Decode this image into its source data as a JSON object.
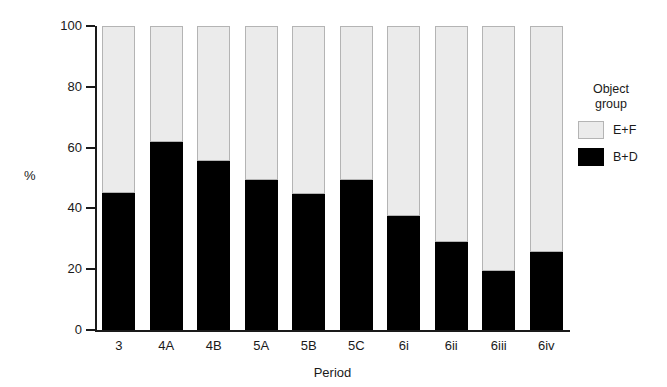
{
  "chart_data": {
    "type": "bar",
    "subtype": "stacked-percentage",
    "title": "",
    "xlabel": "Period",
    "ylabel": "%",
    "ylim": [
      0,
      100
    ],
    "yticks": [
      0,
      20,
      40,
      60,
      80,
      100
    ],
    "grid": false,
    "categories": [
      "3",
      "4A",
      "4B",
      "5A",
      "5B",
      "5C",
      "6i",
      "6ii",
      "6iii",
      "6iv"
    ],
    "series": [
      {
        "name": "B+D",
        "color": "#000000",
        "values": [
          45,
          61.8,
          55.6,
          49.3,
          44.7,
          49.3,
          37.5,
          28.8,
          19.4,
          25.7
        ]
      },
      {
        "name": "E+F",
        "color": "#ebebeb",
        "values": [
          55,
          38.2,
          44.4,
          50.7,
          55.3,
          50.7,
          62.5,
          71.2,
          80.6,
          74.3
        ]
      }
    ],
    "legend": {
      "title_line1": "Object",
      "title_line2": "group",
      "position": "right",
      "entries": [
        {
          "label": "E+F",
          "color": "#ebebeb",
          "style": "light"
        },
        {
          "label": "B+D",
          "color": "#000000",
          "style": "dark"
        }
      ]
    }
  }
}
